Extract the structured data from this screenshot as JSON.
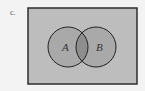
{
  "figure": {
    "part_label": "c.",
    "universe": {
      "x": 28,
      "y": 8,
      "width": 109,
      "height": 76,
      "fill": "#bdbdbd",
      "stroke": "#2e2e2e"
    },
    "sets": [
      {
        "name": "A",
        "cx": 68,
        "cy": 47,
        "r": 20,
        "fill": "#a9a9a9",
        "stroke": "#222222"
      },
      {
        "name": "B",
        "cx": 96,
        "cy": 47,
        "r": 20,
        "fill": "#a9a9a9",
        "stroke": "#222222"
      }
    ],
    "intersection_fill": "#8e8e8e",
    "shaded_region": "A ∪ B"
  }
}
